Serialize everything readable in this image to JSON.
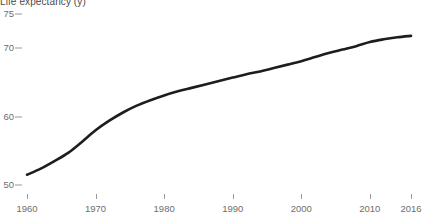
{
  "chart_data": {
    "type": "line",
    "title": "Life expectancy (y)",
    "subtitle": "",
    "xlabel": "",
    "ylabel": "",
    "grid": false,
    "legend": "none",
    "xlim": [
      1960,
      2016
    ],
    "ylim": [
      49,
      76
    ],
    "xticks": [
      1960,
      1970,
      1980,
      1990,
      2000,
      2010,
      2016
    ],
    "xtick_labels": [
      "1960",
      "1970",
      "1980",
      "1990",
      "2000",
      "2010",
      "2016"
    ],
    "yticks": [
      50,
      60,
      70,
      75
    ],
    "ytick_labels": [
      "50",
      "60",
      "70",
      "75"
    ],
    "series": [
      {
        "name": "Life expectancy",
        "color": "#1d1d1b",
        "x": [
          1960,
          1962,
          1964,
          1966,
          1968,
          1970,
          1972,
          1974,
          1976,
          1978,
          1980,
          1982,
          1984,
          1986,
          1988,
          1990,
          1992,
          1994,
          1996,
          1998,
          2000,
          2002,
          2004,
          2006,
          2008,
          2010,
          2012,
          2014,
          2016
        ],
        "values": [
          51.5,
          52.4,
          53.5,
          54.7,
          56.3,
          58.0,
          59.4,
          60.6,
          61.6,
          62.4,
          63.1,
          63.7,
          64.2,
          64.7,
          65.2,
          65.7,
          66.2,
          66.6,
          67.1,
          67.6,
          68.1,
          68.7,
          69.3,
          69.8,
          70.3,
          70.9,
          71.3,
          71.6,
          71.8
        ]
      }
    ]
  }
}
